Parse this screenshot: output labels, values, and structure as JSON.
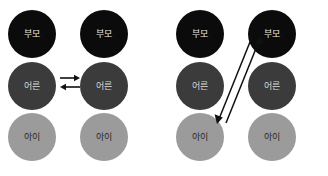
{
  "figure": {
    "title": "",
    "background_color": "#ffffff",
    "node_colors": {
      "parent": "#0b0b0b",
      "adult": "#3b3b3b",
      "child": "#9b9b9b",
      "arrow": "#101010"
    }
  },
  "labels": {
    "parent": "부모",
    "adult": "어른",
    "child": "아이"
  },
  "diagrams": [
    {
      "name": "parallel-transaction",
      "columns": [
        {
          "name": "person-a",
          "nodes": [
            {
              "role": "parent",
              "label": "부모"
            },
            {
              "role": "adult",
              "label": "어른"
            },
            {
              "role": "child",
              "label": "아이"
            }
          ]
        },
        {
          "name": "person-b",
          "nodes": [
            {
              "role": "parent",
              "label": "부모"
            },
            {
              "role": "adult",
              "label": "어른"
            },
            {
              "role": "child",
              "label": "아이"
            }
          ]
        }
      ],
      "arrows": [
        {
          "name": "adult-to-adult-right",
          "from": "a-adult",
          "to": "b-adult",
          "direction": "right",
          "style": "horizontal"
        },
        {
          "name": "adult-to-adult-left",
          "from": "b-adult",
          "to": "a-adult",
          "direction": "left",
          "style": "horizontal"
        }
      ]
    },
    {
      "name": "crossed-transaction",
      "columns": [
        {
          "name": "person-a",
          "nodes": [
            {
              "role": "parent",
              "label": "부모"
            },
            {
              "role": "adult",
              "label": "어른"
            },
            {
              "role": "child",
              "label": "아이"
            }
          ]
        },
        {
          "name": "person-b",
          "nodes": [
            {
              "role": "parent",
              "label": "부모"
            },
            {
              "role": "adult",
              "label": "어른"
            },
            {
              "role": "child",
              "label": "아이"
            }
          ]
        }
      ],
      "arrows": [
        {
          "name": "child-to-parent-up",
          "from": "a-child",
          "to": "b-parent",
          "direction": "up-right",
          "style": "diagonal"
        },
        {
          "name": "parent-to-child-down",
          "from": "b-parent",
          "to": "a-child",
          "direction": "down-left",
          "style": "diagonal"
        }
      ]
    }
  ]
}
